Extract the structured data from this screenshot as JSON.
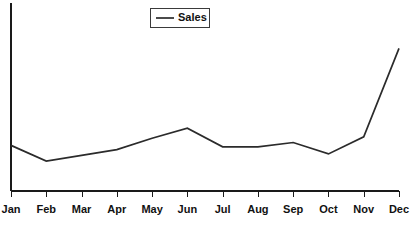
{
  "chart_data": {
    "type": "line",
    "title": "",
    "xlabel": "",
    "ylabel": "",
    "grid": false,
    "legend_position": "top-center",
    "categories": [
      "Jan",
      "Feb",
      "Mar",
      "Apr",
      "May",
      "Jun",
      "Jul",
      "Aug",
      "Sep",
      "Oct",
      "Nov",
      "Dec"
    ],
    "series": [
      {
        "name": "Sales",
        "color": "#2b2b2b",
        "values": [
          32,
          21,
          25,
          29,
          37,
          44,
          31,
          31,
          34,
          26,
          38,
          100
        ]
      }
    ],
    "ylim": [
      0,
      115
    ],
    "xlim": [
      0,
      11
    ],
    "axis_color": "#1a1a1a",
    "background": "#ffffff"
  },
  "legend": {
    "entries": [
      {
        "label": "Sales"
      }
    ]
  },
  "axes": {
    "x_tick_labels": [
      "Jan",
      "Feb",
      "Mar",
      "Apr",
      "May",
      "Jun",
      "Jul",
      "Aug",
      "Sep",
      "Oct",
      "Nov",
      "Dec"
    ],
    "y_tick_labels": []
  }
}
